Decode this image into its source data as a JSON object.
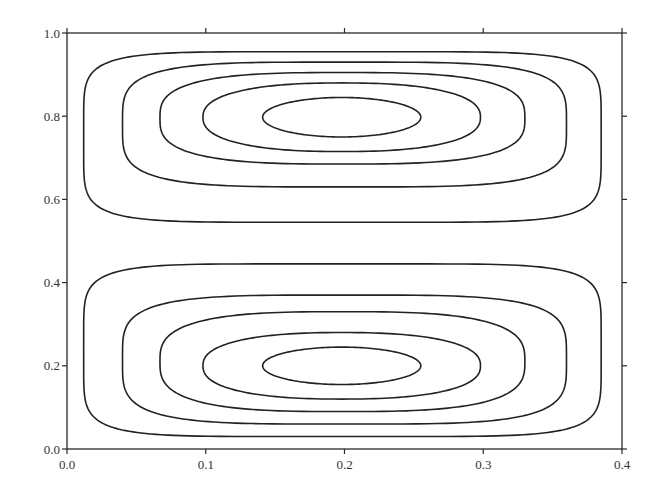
{
  "chart_data": {
    "type": "contour",
    "title": "",
    "xlabel": "",
    "ylabel": "",
    "xlim": [
      0.0,
      0.4
    ],
    "ylim": [
      0.0,
      1.0
    ],
    "grid": false,
    "legend": null,
    "x_ticks": [
      "0.0",
      "0.1",
      "0.2",
      "0.3",
      "0.4"
    ],
    "y_ticks": [
      "0.0",
      "0.2",
      "0.4",
      "0.6",
      "0.8",
      "1.0"
    ],
    "x_tick_values": [
      0.0,
      0.1,
      0.2,
      0.3,
      0.4
    ],
    "y_tick_values": [
      0.0,
      0.2,
      0.4,
      0.6,
      0.8,
      1.0
    ],
    "cells": [
      {
        "name": "upper-cell",
        "center": [
          0.2,
          0.8
        ],
        "contours": [
          {
            "level": 1,
            "x_range": [
              0.012,
              0.385
            ],
            "y_range": [
              0.545,
              0.955
            ],
            "squareness": 6
          },
          {
            "level": 2,
            "x_range": [
              0.04,
              0.36
            ],
            "y_range": [
              0.63,
              0.93
            ],
            "squareness": 4
          },
          {
            "level": 3,
            "x_range": [
              0.067,
              0.33
            ],
            "y_range": [
              0.685,
              0.905
            ],
            "squareness": 3
          },
          {
            "level": 4,
            "x_range": [
              0.098,
              0.298
            ],
            "y_range": [
              0.715,
              0.88
            ],
            "squareness": 2.4
          },
          {
            "level": 5,
            "x_range": [
              0.141,
              0.255
            ],
            "y_range": [
              0.75,
              0.845
            ],
            "squareness": 2
          }
        ]
      },
      {
        "name": "lower-cell",
        "center": [
          0.2,
          0.2
        ],
        "contours": [
          {
            "level": 1,
            "x_range": [
              0.012,
              0.385
            ],
            "y_range": [
              0.03,
              0.445
            ],
            "squareness": 6
          },
          {
            "level": 2,
            "x_range": [
              0.04,
              0.36
            ],
            "y_range": [
              0.06,
              0.37
            ],
            "squareness": 4
          },
          {
            "level": 3,
            "x_range": [
              0.067,
              0.33
            ],
            "y_range": [
              0.09,
              0.33
            ],
            "squareness": 3
          },
          {
            "level": 4,
            "x_range": [
              0.098,
              0.298
            ],
            "y_range": [
              0.12,
              0.28
            ],
            "squareness": 2.4
          },
          {
            "level": 5,
            "x_range": [
              0.141,
              0.255
            ],
            "y_range": [
              0.155,
              0.245
            ],
            "squareness": 2
          }
        ]
      }
    ]
  },
  "layout": {
    "plot_left": 67,
    "plot_right": 622,
    "plot_top": 33,
    "plot_bottom": 449,
    "line_color": "#222222"
  }
}
